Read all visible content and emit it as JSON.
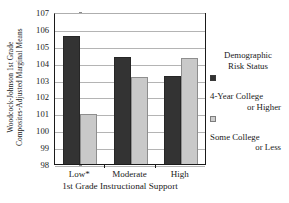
{
  "chart_data": {
    "type": "bar",
    "title": "",
    "xlabel": "1st Grade Instructional Support",
    "ylabel_line1": "Woodcock-Johnson 1st Grade",
    "ylabel_line2": "Composites-Adjusted Marginal Means",
    "categories": [
      "Low*",
      "Moderate",
      "High"
    ],
    "series": [
      {
        "name": "4-Year College or Higher",
        "color": "#333333",
        "values": [
          105.65,
          104.4,
          103.3
        ]
      },
      {
        "name": "Some College or Less",
        "color": "#c9c9c9",
        "values": [
          101.0,
          103.2,
          104.35
        ]
      }
    ],
    "ylim": [
      98,
      107
    ],
    "ytick_labels": [
      "107",
      "106",
      "105",
      "104",
      "103",
      "102",
      "101",
      "100",
      "99",
      "98"
    ],
    "ytick_values": [
      107,
      106,
      105,
      104,
      103,
      102,
      101,
      100,
      99,
      98
    ],
    "ytick_step": 1,
    "grid": true,
    "grid_axis": "y",
    "legend_position": "right"
  },
  "legend": {
    "title_line1": "Demographic",
    "title_line2": "Risk Status",
    "entries": [
      {
        "label_line1": "4-Year College",
        "label_line2": "or Higher",
        "swatch": "dark"
      },
      {
        "label_line1": "Some College",
        "label_line2": "or Less",
        "swatch": "light"
      }
    ]
  }
}
